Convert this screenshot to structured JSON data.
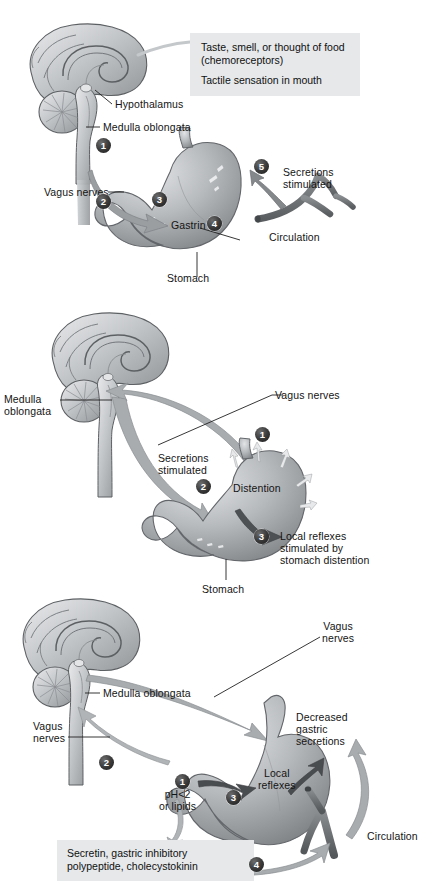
{
  "figure": {
    "panels": [
      {
        "id": "cephalic",
        "name": "Cephalic phase",
        "callout": {
          "line1": "Taste, smell, or thought of food",
          "line2": "(chemoreceptors)",
          "line3": "Tactile sensation in mouth",
          "background": "#e6e8ea"
        },
        "labels": {
          "hypothalamus": "Hypothalamus",
          "medulla_oblongata": "Medulla oblongata",
          "vagus_nerves": "Vagus nerves",
          "gastrin": "Gastrin",
          "stomach": "Stomach",
          "secretions_stimulated": "Secretions\nstimulated",
          "circulation": "Circulation"
        },
        "steps": [
          "1",
          "2",
          "3",
          "4",
          "5"
        ]
      },
      {
        "id": "gastric",
        "name": "Gastric phase",
        "labels": {
          "medulla_oblongata": "Medulla\noblongata",
          "vagus_nerves": "Vagus nerves",
          "secretions_stimulated": "Secretions\nstimulated",
          "distention": "Distention",
          "local_reflexes": "Local reflexes\nstimulated by\nstomach distention",
          "stomach": "Stomach"
        },
        "steps": [
          "1",
          "2",
          "3"
        ]
      },
      {
        "id": "intestinal",
        "name": "Intestinal phase",
        "callout": {
          "line1": "Secretin, gastric inhibitory",
          "line2": "polypeptide, cholecystokinin",
          "background": "#e6e8ea"
        },
        "labels": {
          "vagus_nerves_right": "Vagus\nnerves",
          "medulla_oblongata": "Medulla oblongata",
          "vagus_nerves_left": "Vagus\nnerves",
          "decreased_gastric_secretions": "Decreased\ngastric\nsecretions",
          "local_reflexes": "Local\nreflexes",
          "ph_or_lipids": "pH<2\nor lipids",
          "circulation": "Circulation"
        },
        "steps": [
          "1",
          "2",
          "3",
          "4"
        ]
      }
    ],
    "colors": {
      "callout_bg": "#e6e8ea",
      "brain_light": "#d8dadc",
      "brain_mid": "#a9adb1",
      "brain_dark": "#76797c",
      "stomach_light": "#cfd2d4",
      "stomach_mid": "#a3a7aa",
      "stomach_dark": "#6e7173",
      "nerve": "#b4b8ba",
      "vessel": "#6d7073",
      "text": "#141414",
      "step_badge": "#262626"
    }
  }
}
